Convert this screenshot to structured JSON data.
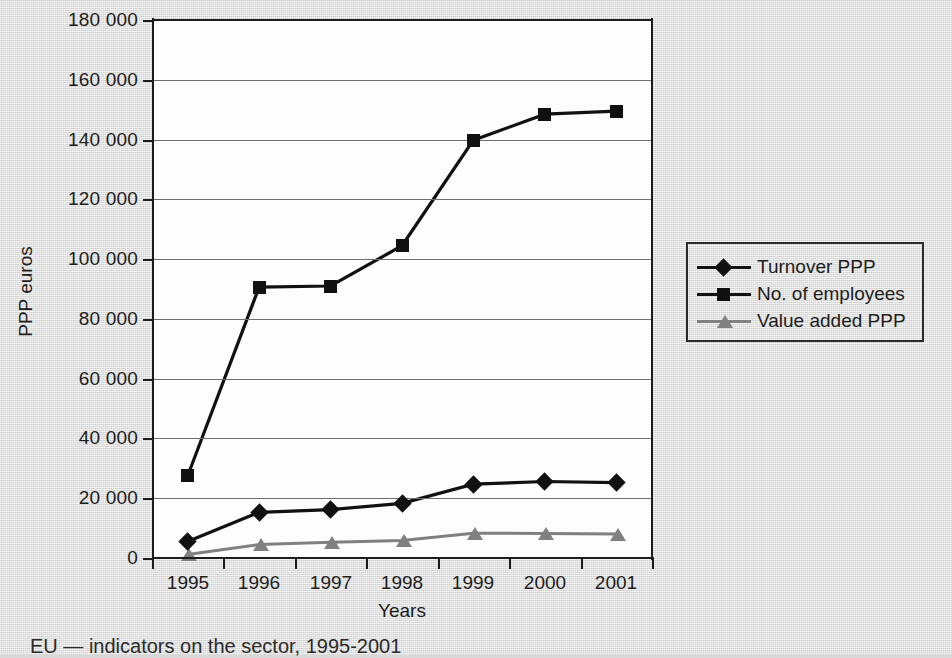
{
  "figure": {
    "caption": "EU — indicators on the sector, 1995-2001",
    "background_color": "#dcdcdc",
    "plot_background_color": "#fdfdfd"
  },
  "legend": {
    "position": "right",
    "items": [
      {
        "label": "Turnover PPP",
        "marker": "diamond",
        "color": "#111111"
      },
      {
        "label": "No. of employees",
        "marker": "square",
        "color": "#111111"
      },
      {
        "label": "Value added PPP",
        "marker": "triangle",
        "color": "#808080"
      }
    ]
  },
  "chart_data": {
    "type": "line",
    "title": "",
    "xlabel": "Years",
    "ylabel": "PPP euros",
    "categories": [
      "1995",
      "1996",
      "1997",
      "1998",
      "1999",
      "2000",
      "2001"
    ],
    "ylim": [
      0,
      180000
    ],
    "ytick_values": [
      0,
      20000,
      40000,
      60000,
      80000,
      100000,
      120000,
      140000,
      160000,
      180000
    ],
    "ytick_labels": [
      "0",
      "20 000",
      "40 000",
      "60 000",
      "80 000",
      "100 000",
      "120 000",
      "140 000",
      "160 000",
      "180 000"
    ],
    "grid": true,
    "legend_position": "right",
    "series": [
      {
        "name": "Turnover PPP",
        "marker": "diamond",
        "color": "#111111",
        "values": [
          5500,
          15300,
          16200,
          18300,
          24700,
          25600,
          25200
        ]
      },
      {
        "name": "No. of employees",
        "marker": "square",
        "color": "#111111",
        "values": [
          27500,
          90600,
          91000,
          104500,
          139800,
          148500,
          149500
        ]
      },
      {
        "name": "Value added PPP",
        "marker": "triangle",
        "color": "#808080",
        "values": [
          1200,
          4500,
          5300,
          5900,
          8300,
          8200,
          8000
        ]
      }
    ]
  }
}
